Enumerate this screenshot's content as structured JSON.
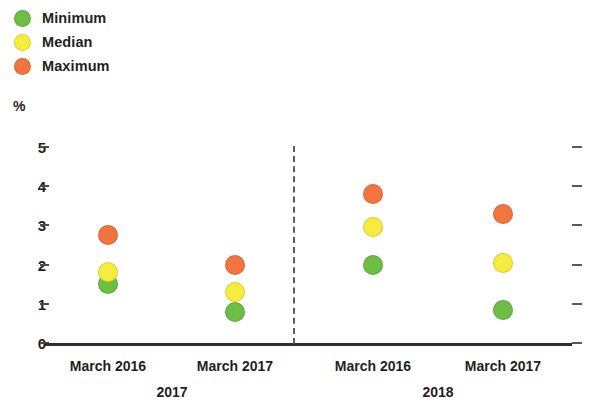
{
  "chart_data": {
    "type": "scatter",
    "title": "",
    "xlabel": "",
    "ylabel": "%",
    "ylim": [
      0,
      5
    ],
    "yticks": [
      0,
      1,
      2,
      3,
      4,
      5
    ],
    "ytick_labels": [
      "0",
      "1",
      "2",
      "3",
      "4",
      "5"
    ],
    "grid": false,
    "legend_position": "top-left",
    "categories": [
      "March 2016",
      "March 2017",
      "March 2016",
      "March 2017"
    ],
    "groups": [
      {
        "label": "2017",
        "categories": [
          "March 2016",
          "March 2017"
        ]
      },
      {
        "label": "2018",
        "categories": [
          "March 2016",
          "March 2017"
        ]
      }
    ],
    "series": [
      {
        "name": "Minimum",
        "color": "#6cbe45",
        "values": [
          1.5,
          0.8,
          2.0,
          0.85
        ]
      },
      {
        "name": "Median",
        "color": "#f5ec3d",
        "values": [
          1.8,
          1.3,
          2.95,
          2.05
        ]
      },
      {
        "name": "Maximum",
        "color": "#f2753f",
        "values": [
          2.75,
          2.0,
          3.8,
          3.3
        ]
      }
    ],
    "annotations": {
      "divider": "dashed vertical separator between 2017 and 2018 groups",
      "right_axis_ticks": "unlabeled tick marks mirroring left axis"
    }
  },
  "legend": {
    "items": [
      {
        "label": "Minimum",
        "color": "#6cbe45"
      },
      {
        "label": "Median",
        "color": "#f5ec3d"
      },
      {
        "label": "Maximum",
        "color": "#f2753f"
      }
    ]
  },
  "axis": {
    "unit": "%",
    "y_labels": [
      "5",
      "4",
      "3",
      "2",
      "1",
      "0"
    ]
  },
  "x_axis": {
    "tick_labels": [
      "March 2016",
      "March 2017",
      "March 2016",
      "March 2017"
    ],
    "group_labels": [
      "2017",
      "2018"
    ]
  }
}
